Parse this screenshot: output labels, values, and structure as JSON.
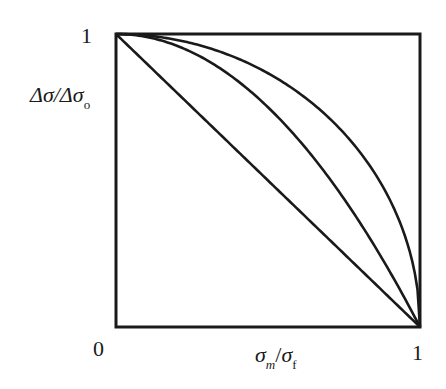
{
  "chart_data": {
    "type": "line",
    "title": "",
    "xlabel": "σm/σf",
    "ylabel": "Δσ/Δσo",
    "xlim": [
      0,
      1
    ],
    "ylim": [
      0,
      1
    ],
    "grid": false,
    "legend": null,
    "x_ticks": [
      "0",
      "1"
    ],
    "y_ticks": [
      "1"
    ],
    "x": [
      0,
      0.1,
      0.2,
      0.3,
      0.4,
      0.5,
      0.6,
      0.7,
      0.8,
      0.9,
      0.95,
      1.0
    ],
    "series": [
      {
        "name": "linear (Goodman-type)",
        "values": [
          1.0,
          0.9,
          0.8,
          0.7,
          0.6,
          0.5,
          0.4,
          0.3,
          0.2,
          0.1,
          0.05,
          0.0
        ]
      },
      {
        "name": "parabolic (Gerber-type)",
        "values": [
          1.0,
          0.99,
          0.96,
          0.91,
          0.84,
          0.75,
          0.64,
          0.51,
          0.36,
          0.19,
          0.1,
          0.0
        ]
      },
      {
        "name": "elliptic",
        "values": [
          1.0,
          0.995,
          0.98,
          0.954,
          0.917,
          0.866,
          0.8,
          0.714,
          0.6,
          0.436,
          0.312,
          0.0
        ]
      }
    ]
  },
  "labels": {
    "y_tick_top": "1",
    "x_tick_left": "0",
    "x_tick_right": "1",
    "y_axis_main": "Δσ/Δσ",
    "y_axis_sub": "o",
    "x_axis_num": "σ",
    "x_axis_num_sub": "m",
    "x_axis_slash": "/",
    "x_axis_den": "σ",
    "x_axis_den_sub": "f"
  },
  "style": {
    "line_color": "#1a1a1a",
    "background": "#ffffff"
  }
}
